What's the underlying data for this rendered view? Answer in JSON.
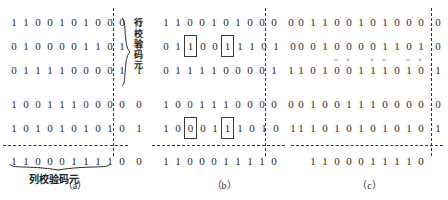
{
  "figure": {
    "labels": {
      "row_parity": "行校验码元",
      "row_parity_chars": [
        "行",
        "校",
        "验",
        "码",
        "元"
      ],
      "col_parity": "列校验码元"
    },
    "captions": {
      "a": "（a）",
      "b": "（b）",
      "c": "（c）"
    }
  },
  "panels": [
    {
      "id": "a",
      "caption": "（a）",
      "data_rows": [
        {
          "bits": [
            "1",
            "1",
            "0",
            "0",
            "1",
            "0",
            "1",
            "0",
            "0",
            "0"
          ],
          "parity": "0"
        },
        {
          "bits": [
            "0",
            "1",
            "0",
            "0",
            "0",
            "0",
            "1",
            "1",
            "0",
            "1"
          ],
          "parity": "0"
        },
        {
          "bits": [
            "0",
            "1",
            "1",
            "1",
            "1",
            "0",
            "0",
            "0",
            "0",
            "1"
          ],
          "parity": "1"
        },
        {
          "bits": [
            "1",
            "0",
            "0",
            "1",
            "1",
            "1",
            "0",
            "0",
            "0",
            "0"
          ],
          "parity": "0"
        },
        {
          "bits": [
            "1",
            "0",
            "1",
            "0",
            "1",
            "0",
            "1",
            "0",
            "1",
            "0"
          ],
          "parity": "1"
        }
      ],
      "parity_row": {
        "bits": [
          "1",
          "1",
          "0",
          "0",
          "0",
          "1",
          "1",
          "1",
          "1",
          "0"
        ],
        "parity": "0"
      },
      "boxed": [],
      "xmarks": []
    },
    {
      "id": "b",
      "caption": "（b）",
      "data_rows": [
        {
          "bits": [
            "1",
            "1",
            "0",
            "0",
            "1",
            "0",
            "1",
            "0",
            "0",
            "0"
          ],
          "parity": "0"
        },
        {
          "bits": [
            "0",
            "1",
            "1",
            "0",
            "0",
            "1",
            "1",
            "1",
            "0",
            "1"
          ],
          "parity": "0"
        },
        {
          "bits": [
            "0",
            "1",
            "1",
            "1",
            "1",
            "0",
            "0",
            "0",
            "0",
            "1"
          ],
          "parity": "1"
        },
        {
          "bits": [
            "1",
            "0",
            "0",
            "1",
            "1",
            "1",
            "0",
            "0",
            "0",
            "0"
          ],
          "parity": "0"
        },
        {
          "bits": [
            "1",
            "0",
            "0",
            "0",
            "1",
            "1",
            "1",
            "0",
            "1",
            "0"
          ],
          "parity": "1"
        }
      ],
      "parity_row": {
        "bits": [
          "1",
          "1",
          "0",
          "0",
          "0",
          "1",
          "1",
          "1",
          "1",
          "0"
        ],
        "parity": ""
      },
      "boxed": [
        {
          "row": 1,
          "col": 2
        },
        {
          "row": 1,
          "col": 5
        },
        {
          "row": 4,
          "col": 2
        },
        {
          "row": 4,
          "col": 5
        }
      ],
      "xmarks": []
    },
    {
      "id": "c",
      "caption": "（c）",
      "data_rows": [
        {
          "bits": [
            "0",
            "1",
            "1",
            "0",
            "0",
            "1",
            "0",
            "1",
            "0",
            "0",
            "0"
          ],
          "parity": "0"
        },
        {
          "bits": [
            "0",
            "0",
            "1",
            "0",
            "0",
            "0",
            "0",
            "1",
            "1",
            "0",
            "1"
          ],
          "parity": "0"
        },
        {
          "bits": [
            "1",
            "0",
            "1",
            "0",
            "0",
            "1",
            "1",
            "1",
            "0",
            "1",
            "0"
          ],
          "parity": "1"
        },
        {
          "bits": [
            "0",
            "1",
            "0",
            "0",
            "1",
            "1",
            "1",
            "0",
            "0",
            "0",
            "0"
          ],
          "parity": "0"
        },
        {
          "bits": [
            "1",
            "1",
            "0",
            "1",
            "0",
            "1",
            "0",
            "1",
            "0",
            "1",
            "0"
          ],
          "parity": "1"
        }
      ],
      "parity_row": {
        "bits": [
          "1",
          "1",
          "0",
          "0",
          "0",
          "1",
          "1",
          "1",
          "1",
          "0"
        ],
        "parity": ""
      },
      "boxed": [],
      "xmarks": {
        "row": 2,
        "cols": [
          3,
          4,
          6,
          7,
          9,
          10
        ],
        "glyph": "×"
      }
    }
  ]
}
